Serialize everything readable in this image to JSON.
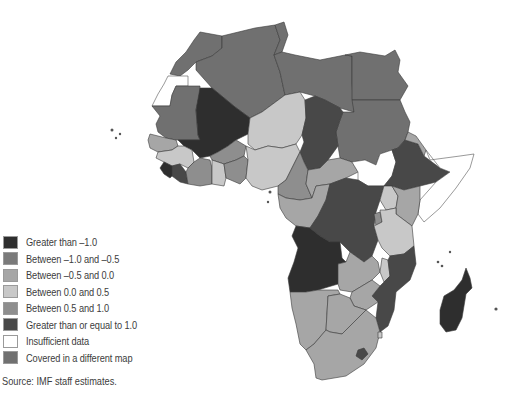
{
  "colors": {
    "gt_neg1": "#2e2e2e",
    "neg1_neg05": "#7a7a7a",
    "neg05_0": "#a6a6a6",
    "0_05": "#c8c8c8",
    "05_1": "#8e8e8e",
    "ge1": "#484848",
    "insufficient": "#ffffff",
    "covered": "#707070"
  },
  "legend": {
    "items": [
      {
        "label": "Greater than –1.0",
        "color": "#2e2e2e"
      },
      {
        "label": "Between –1.0 and –0.5",
        "color": "#7a7a7a"
      },
      {
        "label": "Between –0.5 and 0.0",
        "color": "#a6a6a6"
      },
      {
        "label": "Between 0.0 and 0.5",
        "color": "#c8c8c8"
      },
      {
        "label": "Between 0.5 and 1.0",
        "color": "#8e8e8e"
      },
      {
        "label": "Greater than or equal to 1.0",
        "color": "#484848"
      },
      {
        "label": "Insufficient data",
        "color": "#ffffff"
      },
      {
        "label": "Covered in a different map",
        "color": "#707070"
      }
    ]
  },
  "source": "Source: IMF staff estimates.",
  "map": {
    "regions": [
      {
        "name": "Morocco",
        "category": "covered"
      },
      {
        "name": "Algeria",
        "category": "covered"
      },
      {
        "name": "Tunisia",
        "category": "covered"
      },
      {
        "name": "Libya",
        "category": "covered"
      },
      {
        "name": "Egypt",
        "category": "covered"
      },
      {
        "name": "Sudan",
        "category": "covered"
      },
      {
        "name": "Mauritania",
        "category": "covered"
      },
      {
        "name": "Western Sahara",
        "category": "insufficient"
      },
      {
        "name": "Mali",
        "category": "gt_neg1"
      },
      {
        "name": "Niger",
        "category": "0_05"
      },
      {
        "name": "Chad",
        "category": "ge1"
      },
      {
        "name": "Nigeria",
        "category": "0_05"
      },
      {
        "name": "Ethiopia",
        "category": "ge1"
      },
      {
        "name": "South Sudan",
        "category": "insufficient"
      },
      {
        "name": "Somalia",
        "category": "insufficient"
      },
      {
        "name": "DR Congo",
        "category": "ge1"
      },
      {
        "name": "Angola",
        "category": "gt_neg1"
      },
      {
        "name": "Mozambique",
        "category": "ge1"
      },
      {
        "name": "Madagascar",
        "category": "gt_neg1"
      },
      {
        "name": "South Africa",
        "category": "neg05_0"
      }
    ]
  }
}
